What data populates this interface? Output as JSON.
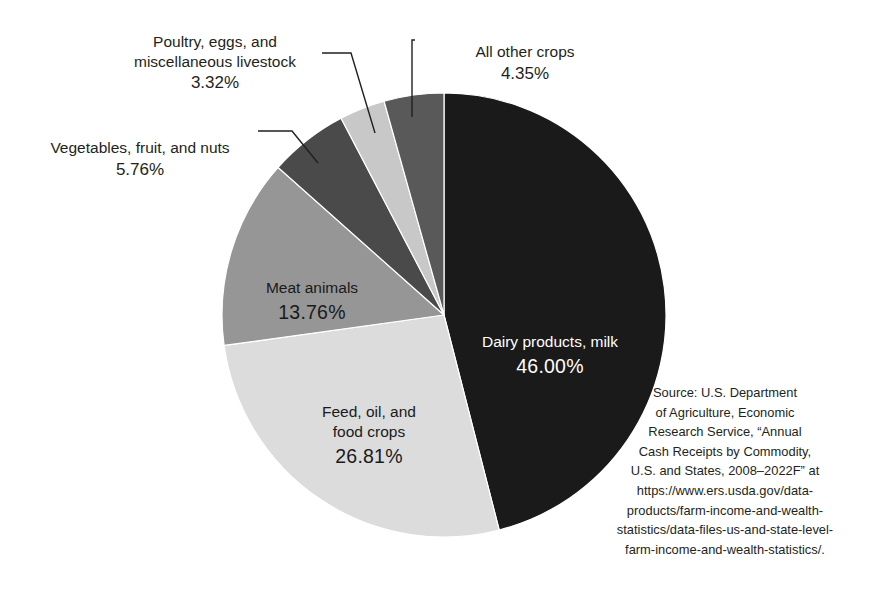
{
  "chart_data": {
    "type": "pie",
    "title": "",
    "subtitle": "",
    "legend_position": "callout-labels",
    "grid": false,
    "units": "percent",
    "start_angle_deg": 0,
    "direction": "clockwise",
    "categories": [
      "Dairy products, milk",
      "Feed, oil, and food crops",
      "Meat animals",
      "Vegetables, fruit, and nuts",
      "Poultry, eggs, and miscellaneous livestock",
      "All other crops"
    ],
    "values": [
      46.0,
      26.81,
      13.76,
      5.76,
      3.32,
      4.35
    ],
    "value_labels": [
      "46.00%",
      "26.81%",
      "13.76%",
      "5.76%",
      "3.32%",
      "4.35%"
    ],
    "colors": [
      "#1a1a1a",
      "#dcdcdc",
      "#969696",
      "#4a4a4a",
      "#c8c8c8",
      "#595959"
    ],
    "slices": [
      {
        "name": "Dairy products, milk",
        "label": "Dairy products, milk",
        "percent_label": "46.00%",
        "value": 46.0,
        "color": "#1a1a1a",
        "label_placement": "inside",
        "label_color": "#ffffff"
      },
      {
        "name": "Feed, oil, and food crops",
        "label": "Feed, oil, and\nfood crops",
        "percent_label": "26.81%",
        "value": 26.81,
        "color": "#dcdcdc",
        "label_placement": "inside",
        "label_color": "#1a1a1a"
      },
      {
        "name": "Meat animals",
        "label": "Meat animals",
        "percent_label": "13.76%",
        "value": 13.76,
        "color": "#969696",
        "label_placement": "inside",
        "label_color": "#1a1a1a"
      },
      {
        "name": "Vegetables, fruit, and nuts",
        "label": "Vegetables, fruit, and nuts",
        "percent_label": "5.76%",
        "value": 5.76,
        "color": "#4a4a4a",
        "label_placement": "callout-left",
        "label_color": "#231f20"
      },
      {
        "name": "Poultry, eggs, and miscellaneous livestock",
        "label": "Poultry, eggs, and\nmiscellaneous livestock",
        "percent_label": "3.32%",
        "value": 3.32,
        "color": "#c8c8c8",
        "label_placement": "callout-upper-left",
        "label_color": "#231f20"
      },
      {
        "name": "All other crops",
        "label": "All other crops",
        "percent_label": "4.35%",
        "value": 4.35,
        "color": "#595959",
        "label_placement": "callout-top",
        "label_color": "#231f20"
      }
    ],
    "source_note": "Source: U.S. Department of Agriculture, Economic Research Service, “Annual Cash Receipts by Commodity, U.S. and States, 2008–2022F” at https://www.ers.usda.gov/data-products/farm-income-and-wealth-statistics/data-files-us-and-state-level-farm-income-and-wealth-statistics/."
  },
  "labels": {
    "poultry": {
      "text": "Poultry, eggs, and\nmiscellaneous livestock",
      "percent": "3.32%"
    },
    "vegetables": {
      "text": "Vegetables, fruit, and nuts",
      "percent": "5.76%"
    },
    "all_other_crops": {
      "text": "All other crops",
      "percent": "4.35%"
    },
    "dairy": {
      "text": "Dairy products, milk",
      "percent": "46.00%"
    },
    "meat": {
      "text": "Meat animals",
      "percent": "13.76%"
    },
    "feed": {
      "text": "Feed, oil, and\nfood crops",
      "percent": "26.81%"
    }
  },
  "source": {
    "text": "Source: U.S. Department\nof Agriculture, Economic\nResearch Service, “Annual\nCash Receipts by Commodity,\nU.S. and States, 2008–2022F” at\nhttps://www.ers.usda.gov/data-\nproducts/farm-income-and-wealth-\nstatistics/data-files-us-and-state-level-\nfarm-income-and-wealth-statistics/."
  }
}
